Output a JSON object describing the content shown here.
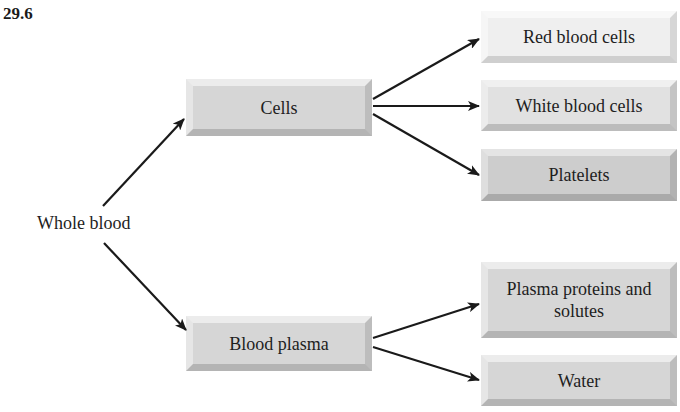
{
  "figure": {
    "number": "29.6"
  },
  "root": {
    "label": "Whole blood"
  },
  "branches": {
    "cells": {
      "label": "Cells",
      "children": [
        {
          "label": "Red blood cells"
        },
        {
          "label": "White blood cells"
        },
        {
          "label": "Platelets"
        }
      ]
    },
    "plasma": {
      "label": "Blood plasma",
      "children": [
        {
          "label": "Plasma proteins and solutes"
        },
        {
          "label": "Water"
        }
      ]
    }
  },
  "colors": {
    "arrow": "#1a1a1a",
    "box_fill": "#d6d6d6",
    "box_fill_light": "#efefef",
    "text": "#1e1e1e"
  }
}
